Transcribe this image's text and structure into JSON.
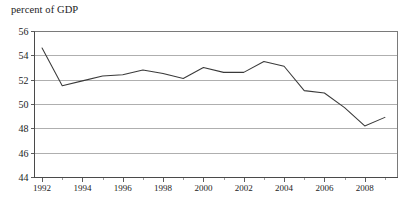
{
  "chart_data": {
    "type": "line",
    "title": "percent of GDP",
    "xlabel": "",
    "ylabel": "",
    "ylim": [
      44,
      56
    ],
    "xlim": [
      1991.6,
      2009.6
    ],
    "ytick_labels": [
      "44",
      "46",
      "48",
      "50",
      "52",
      "54",
      "56"
    ],
    "ytick_values": [
      44,
      46,
      48,
      50,
      52,
      54,
      56
    ],
    "xtick_labels": [
      "1992",
      "1994",
      "1996",
      "1998",
      "2000",
      "2002",
      "2004",
      "2006",
      "2008"
    ],
    "xtick_values": [
      1992,
      1994,
      1996,
      1998,
      2000,
      2002,
      2004,
      2006,
      2008
    ],
    "xtick_minor_values": [
      1993,
      1995,
      1997,
      1999,
      2001,
      2003,
      2005,
      2007,
      2009
    ],
    "grid": true,
    "grid_axis": "y",
    "legend": false,
    "legend_position": "none",
    "line_color": "#3a3a3a",
    "grid_color": "#8d8d8d",
    "frame_color": "#6b6b6b",
    "x": [
      1992,
      1993,
      1994,
      1995,
      1996,
      1997,
      1998,
      1999,
      2000,
      2001,
      2002,
      2003,
      2004,
      2005,
      2006,
      2007,
      2008,
      2009
    ],
    "values": [
      54.6,
      51.5,
      51.9,
      52.3,
      52.4,
      52.8,
      52.5,
      52.1,
      53.0,
      52.6,
      52.6,
      53.5,
      53.1,
      51.1,
      50.9,
      49.7,
      48.2,
      48.9
    ],
    "series": [
      {
        "name": "percent of GDP",
        "values": [
          54.6,
          51.5,
          51.9,
          52.3,
          52.4,
          52.8,
          52.5,
          52.1,
          53.0,
          52.6,
          52.6,
          53.5,
          53.1,
          51.1,
          50.9,
          49.7,
          48.2,
          48.9
        ]
      }
    ],
    "annotations": []
  },
  "plot_geometry": {
    "left": 34,
    "right": 397,
    "top": 31,
    "bottom": 177
  }
}
